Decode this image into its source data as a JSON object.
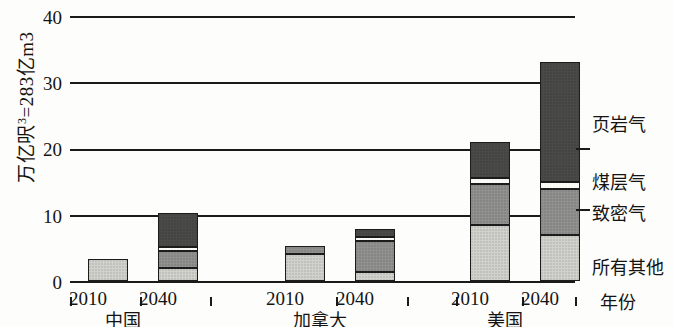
{
  "chart_data": {
    "type": "bar",
    "stacked": true,
    "title": "",
    "subtitle": "",
    "xlabel": "年份",
    "ylabel": "万亿呎³=283亿m3",
    "ylim": [
      0,
      40
    ],
    "yticks": [
      0,
      10,
      20,
      30,
      40
    ],
    "grid": true,
    "legend_position": "right",
    "categories": [
      "2010",
      "2040",
      "2010",
      "2040",
      "2010",
      "2040"
    ],
    "groups": [
      {
        "name": "中国",
        "years": [
          "2010",
          "2040"
        ]
      },
      {
        "name": "加拿大",
        "years": [
          "2010",
          "2040"
        ]
      },
      {
        "name": "美国",
        "years": [
          "2010",
          "2040"
        ]
      }
    ],
    "series": [
      {
        "name": "所有其他",
        "color": "#d2d2cd",
        "values": [
          3.3,
          2.0,
          4.1,
          1.3,
          8.4,
          6.9
        ]
      },
      {
        "name": "致密气",
        "color": "#919190",
        "values": [
          0.0,
          2.6,
          1.2,
          4.7,
          6.2,
          7.0
        ]
      },
      {
        "name": "煤层气",
        "color": "#fbfbf8",
        "values": [
          0.0,
          0.6,
          0.0,
          0.7,
          0.9,
          1.0
        ]
      },
      {
        "name": "页岩气",
        "color": "#4a4a49",
        "values": [
          0.0,
          5.0,
          0.0,
          1.1,
          5.5,
          18.1
        ]
      }
    ],
    "totals": [
      3.3,
      10.2,
      5.3,
      7.8,
      21.0,
      33.0
    ]
  },
  "axis": {
    "y_title_main": "万亿呎",
    "y_title_sup": "3",
    "y_title_tail": "=283亿m3",
    "y_ticks": [
      "40",
      "30",
      "20",
      "10",
      "0"
    ],
    "x_title": "年份"
  },
  "x_labels": {
    "years": [
      "2010",
      "2040",
      "2010",
      "2040",
      "2010",
      "2040"
    ],
    "groups": [
      "中国",
      "加拿大",
      "美国"
    ]
  },
  "legend": {
    "items": [
      {
        "label": "页岩气"
      },
      {
        "label": "煤层气"
      },
      {
        "label": "致密气"
      },
      {
        "label": "所有其他"
      }
    ]
  }
}
